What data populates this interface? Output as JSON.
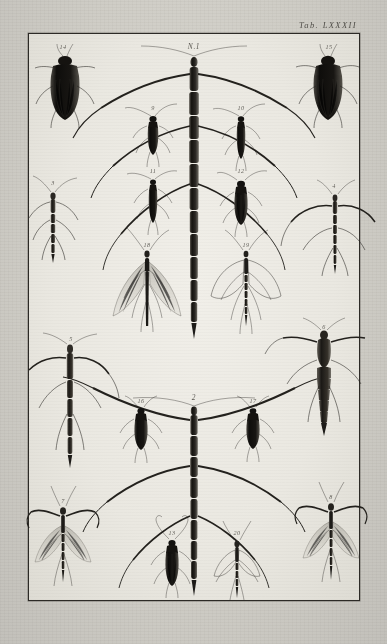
{
  "plate": {
    "label": "Tab. LXXXII",
    "main_figure_label": "N.1",
    "second_main_label": "2",
    "paper_color": "#ccc9c3",
    "plate_field_color": "#eeece6",
    "ink_color": "#23211d",
    "frame": {
      "x": 28,
      "y": 33,
      "width": 330,
      "height": 566
    }
  },
  "figures": [
    {
      "num": "N.1",
      "name": "giant-stick-insect-central-upper",
      "kind": "stick-insect",
      "x": 193,
      "y": 40,
      "label_x": 193,
      "label_y": 41,
      "big": true
    },
    {
      "num": "2",
      "name": "giant-stick-insect-central-lower",
      "kind": "stick-insect",
      "x": 193,
      "y": 392,
      "label_x": 193,
      "label_y": 392,
      "big": true
    },
    {
      "num": "3",
      "name": "stick-insect-left-upper",
      "kind": "stick-insect",
      "x": 52,
      "y": 178,
      "label_x": 52,
      "label_y": 178,
      "big": false
    },
    {
      "num": "4",
      "name": "stick-insect-right-upper",
      "kind": "stick-insect",
      "x": 333,
      "y": 181,
      "label_x": 333,
      "label_y": 181,
      "big": false
    },
    {
      "num": "5",
      "name": "stick-insect-left-middle",
      "kind": "stick-insect",
      "x": 70,
      "y": 334,
      "label_x": 70,
      "label_y": 334,
      "big": false
    },
    {
      "num": "6",
      "name": "broad-bodied-insect-right-middle",
      "kind": "broad-body",
      "x": 323,
      "y": 322,
      "label_x": 323,
      "label_y": 322,
      "big": false
    },
    {
      "num": "7",
      "name": "winged-mantis-left-bottom",
      "kind": "winged-mantis",
      "x": 62,
      "y": 496,
      "label_x": 62,
      "label_y": 496,
      "big": false
    },
    {
      "num": "8",
      "name": "winged-mantis-right-bottom",
      "kind": "winged-mantis",
      "x": 330,
      "y": 492,
      "label_x": 330,
      "label_y": 492,
      "big": false
    },
    {
      "num": "9",
      "name": "longhorn-beetle-upper-left-inner",
      "kind": "longhorn-beetle",
      "x": 152,
      "y": 103,
      "label_x": 152,
      "label_y": 103,
      "big": false
    },
    {
      "num": "10",
      "name": "longhorn-beetle-upper-right-inner",
      "kind": "longhorn-beetle",
      "x": 240,
      "y": 103,
      "label_x": 240,
      "label_y": 103,
      "big": false
    },
    {
      "num": "11",
      "name": "slender-beetle-mid-left-inner",
      "kind": "longhorn-beetle",
      "x": 152,
      "y": 166,
      "label_x": 152,
      "label_y": 166,
      "big": false
    },
    {
      "num": "12",
      "name": "round-beetle-mid-right-inner",
      "kind": "round-beetle",
      "x": 240,
      "y": 166,
      "label_x": 240,
      "label_y": 166,
      "big": false
    },
    {
      "num": "13",
      "name": "beetle-bottom-center-left",
      "kind": "longhorn-beetle",
      "x": 171,
      "y": 528,
      "label_x": 171,
      "label_y": 528,
      "big": false
    },
    {
      "num": "14",
      "name": "water-beetle-top-left",
      "kind": "big-beetle",
      "x": 62,
      "y": 42,
      "label_x": 62,
      "label_y": 42,
      "big": false
    },
    {
      "num": "15",
      "name": "water-beetle-top-right",
      "kind": "big-beetle",
      "x": 328,
      "y": 42,
      "label_x": 328,
      "label_y": 42,
      "big": false
    },
    {
      "num": "16",
      "name": "small-beetle-lower-left-inner",
      "kind": "round-beetle",
      "x": 140,
      "y": 396,
      "label_x": 140,
      "label_y": 396,
      "big": false
    },
    {
      "num": "17",
      "name": "small-beetle-lower-right-inner",
      "kind": "round-beetle",
      "x": 252,
      "y": 396,
      "label_x": 252,
      "label_y": 396,
      "big": false
    },
    {
      "num": "18",
      "name": "veined-wing-insect-left",
      "kind": "veined-wing",
      "x": 146,
      "y": 240,
      "label_x": 146,
      "label_y": 240,
      "big": false
    },
    {
      "num": "19",
      "name": "outlined-wing-insect-right",
      "kind": "outlined-wing",
      "x": 245,
      "y": 240,
      "label_x": 245,
      "label_y": 240,
      "big": false
    },
    {
      "num": "20",
      "name": "wing-insect-bottom-center-right",
      "kind": "outlined-wing",
      "x": 236,
      "y": 528,
      "label_x": 236,
      "label_y": 528,
      "big": false
    }
  ]
}
